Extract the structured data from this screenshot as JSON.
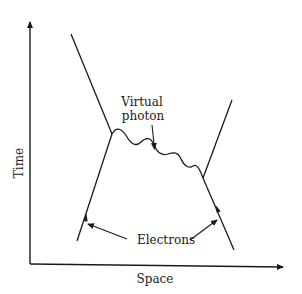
{
  "diagram": {
    "type": "feynman-diagram",
    "axes": {
      "x_label": "Space",
      "y_label": "Time"
    },
    "labels": {
      "photon_line1": "Virtual",
      "photon_line2": "photon",
      "electrons": "Electrons"
    },
    "colors": {
      "line": "#1a1a1a",
      "background": "#ffffff"
    }
  }
}
